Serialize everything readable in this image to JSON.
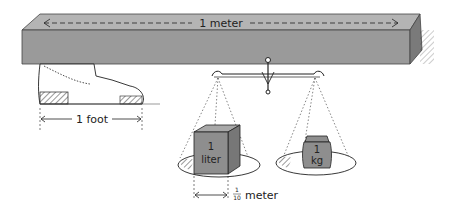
{
  "diagram": {
    "meter_bar": {
      "label": "1 meter",
      "color": "#9a9a9a"
    },
    "shoe": {
      "label": "1 foot"
    },
    "scale": {
      "left_pan": {
        "object": "cube",
        "label_line1": "1",
        "label_line2": "liter",
        "dimension_label": "meter",
        "fraction_num": "1",
        "fraction_den": "10"
      },
      "right_pan": {
        "object": "weight",
        "label_line1": "1",
        "label_line2": "kg"
      }
    },
    "colors": {
      "object_fill": "#8e8e8e",
      "ink": "#222222",
      "paper": "#ffffff"
    }
  }
}
